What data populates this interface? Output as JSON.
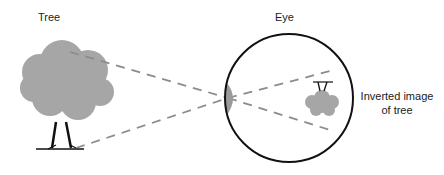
{
  "diagram": {
    "labels": {
      "tree": "Tree",
      "eye": "Eye",
      "inverted_line1": "Inverted image",
      "inverted_line2": "of tree"
    },
    "colors": {
      "foliage": "#a6a6a6",
      "outline": "#111111",
      "dash": "#8c8c8c",
      "lens": "#9a9a9a"
    }
  }
}
